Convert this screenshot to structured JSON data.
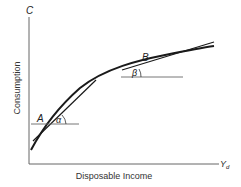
{
  "figure": {
    "y_axis": {
      "symbol": "C",
      "label": "Consumption"
    },
    "x_axis": {
      "symbol": "Y",
      "symbol_subscript": "d",
      "label": "Disposable Income"
    },
    "points": [
      {
        "name": "A",
        "angle": "α"
      },
      {
        "name": "B",
        "angle": "β"
      }
    ],
    "colors": {
      "line": "#1a1a1a",
      "thin_line": "#555555",
      "background": "#ffffff"
    }
  }
}
